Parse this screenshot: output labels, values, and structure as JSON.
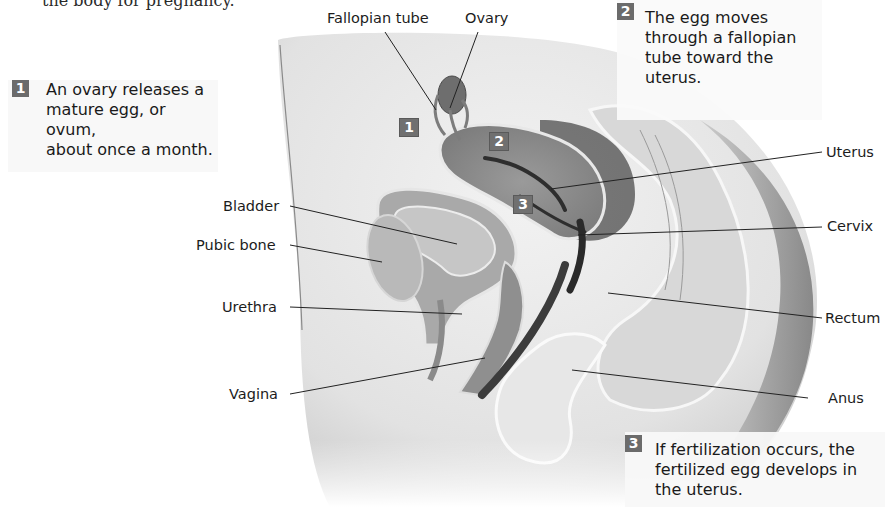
{
  "intro_text_fragment": "the body for pregnancy.",
  "steps": [
    {
      "number": "1",
      "text_lines": [
        "An ovary releases a",
        "mature egg, or ovum,",
        "about once a month."
      ]
    },
    {
      "number": "2",
      "text_lines": [
        "The egg moves",
        "through a fallopian",
        "tube toward the",
        "uterus."
      ]
    },
    {
      "number": "3",
      "text_lines": [
        "If fertilization occurs, the",
        "fertilized egg develops in",
        "the uterus."
      ]
    }
  ],
  "labels": {
    "fallopian_tube": "Fallopian tube",
    "ovary": "Ovary",
    "uterus": "Uterus",
    "cervix": "Cervix",
    "rectum": "Rectum",
    "anus": "Anus",
    "bladder": "Bladder",
    "pubic_bone": "Pubic bone",
    "urethra": "Urethra",
    "vagina": "Vagina"
  },
  "diagram_markers": [
    "1",
    "2",
    "3"
  ],
  "colors": {
    "badge": "#6b6b6b",
    "tissue_light": "#e4e4e4",
    "tissue_mid": "#a8a8a8",
    "tissue_dark": "#5e5e5e",
    "leader_line": "#222222"
  }
}
